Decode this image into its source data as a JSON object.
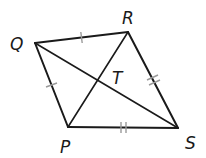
{
  "figure": {
    "type": "quadrilateral",
    "vertices": [
      {
        "name": "Q",
        "x": 35,
        "y": 43,
        "label_x": 10,
        "label_y": 50
      },
      {
        "name": "R",
        "x": 128,
        "y": 32,
        "label_x": 122,
        "label_y": 24
      },
      {
        "name": "S",
        "x": 178,
        "y": 128,
        "label_x": 185,
        "label_y": 149
      },
      {
        "name": "P",
        "x": 68,
        "y": 127,
        "label_x": 60,
        "label_y": 153
      }
    ],
    "intersection": {
      "name": "T",
      "label_x": 112,
      "label_y": 84
    },
    "sides": [
      "QR",
      "RS",
      "SP",
      "PQ"
    ],
    "diagonals": [
      "QS",
      "PR"
    ],
    "congruence_marks": [
      {
        "segment": "QR",
        "ticks": 1
      },
      {
        "segment": "PQ",
        "ticks": 1
      },
      {
        "segment": "RS",
        "ticks": 2
      },
      {
        "segment": "SP",
        "ticks": 2
      }
    ],
    "stroke_color": "#1a1a1a",
    "tick_color": "#9a9a9a"
  },
  "labels": {
    "Q": "Q",
    "R": "R",
    "S": "S",
    "P": "P",
    "T": "T"
  }
}
